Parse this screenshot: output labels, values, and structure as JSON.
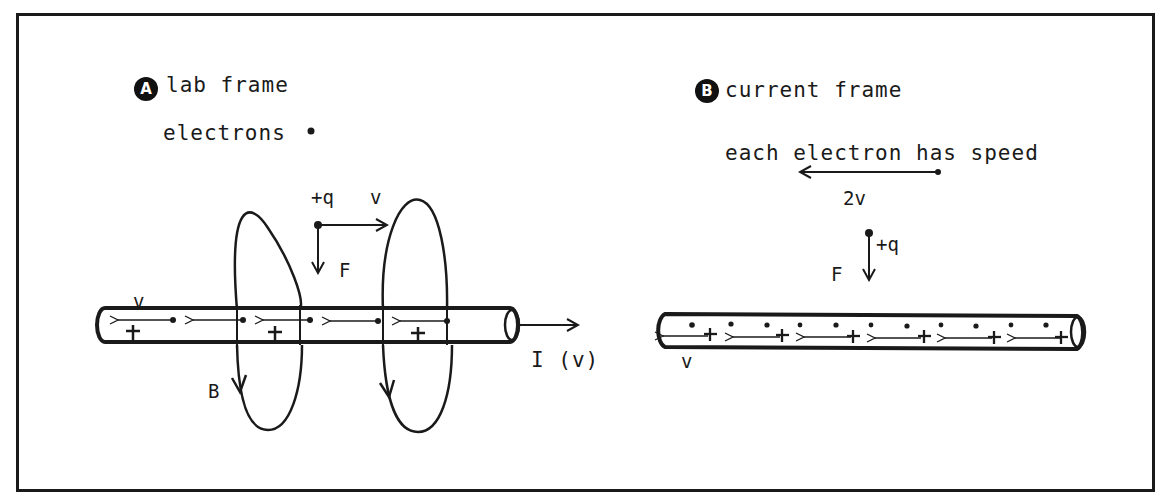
{
  "panel_a": {
    "badge": "A",
    "title": "lab frame",
    "legend_electrons": "electrons",
    "charge_label": "+q",
    "velocity_label": "v",
    "force_label": "F",
    "wire_velocity_label": "v",
    "field_label": "B",
    "current_label": "I (v)"
  },
  "panel_b": {
    "badge": "B",
    "title": "current frame",
    "speed_note": "each electron has speed",
    "speed_value": "2v",
    "charge_label": "+q",
    "force_label": "F",
    "wire_velocity_label": "v"
  },
  "colors": {
    "ink": "#1a1a1a",
    "background": "#ffffff"
  }
}
